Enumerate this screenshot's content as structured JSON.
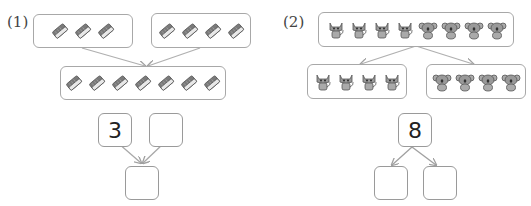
{
  "problems": [
    {
      "label": "(1)",
      "type": "combine",
      "top_left_group": {
        "item": "eraser-icon",
        "count": 3
      },
      "top_right_group": {
        "item": "eraser-icon",
        "count": 4
      },
      "bottom_group": {
        "item": "eraser-icon",
        "count": 7
      },
      "number_bond": {
        "left_part": "3",
        "right_part": "",
        "whole": ""
      }
    },
    {
      "label": "(2)",
      "type": "decompose",
      "top_group": {
        "items": [
          {
            "item": "cat-icon",
            "count": 4
          },
          {
            "item": "koala-icon",
            "count": 4
          }
        ],
        "count": 8
      },
      "bottom_left_group": {
        "item": "cat-icon",
        "count": 4
      },
      "bottom_right_group": {
        "item": "koala-icon",
        "count": 4
      },
      "number_bond": {
        "whole": "8",
        "left_part": "",
        "right_part": ""
      }
    }
  ],
  "colors": {
    "border": "#a8a8a8",
    "arrow": "#b0b0b0",
    "icon_fill": "#8a8a8a"
  }
}
